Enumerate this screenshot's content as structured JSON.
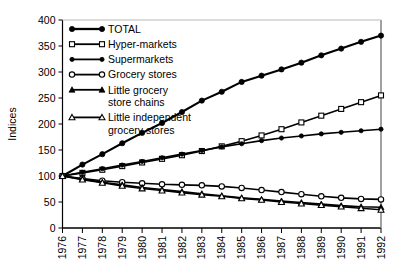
{
  "chart_data": {
    "type": "line",
    "title": "",
    "subtitle": "",
    "xlabel": "",
    "ylabel": "Indices",
    "xlim": [
      1976,
      1992
    ],
    "ylim": [
      0,
      400
    ],
    "yticks": [
      0,
      50,
      100,
      150,
      200,
      250,
      300,
      350,
      400
    ],
    "grid": false,
    "legend_position": "top-left-inside",
    "x": [
      1976,
      1977,
      1978,
      1979,
      1980,
      1981,
      1982,
      1983,
      1984,
      1985,
      1986,
      1987,
      1988,
      1989,
      1990,
      1991,
      1992
    ],
    "categories": [
      "1976",
      "1977",
      "1978",
      "1979",
      "1980",
      "1981",
      "1982",
      "1983",
      "1984",
      "1985",
      "1986",
      "1987",
      "1988",
      "1989",
      "1990",
      "1991",
      "1992"
    ],
    "series": [
      {
        "name": "TOTAL",
        "marker": "filled-circle",
        "values": [
          100,
          122,
          142,
          163,
          183,
          202,
          223,
          245,
          262,
          281,
          293,
          305,
          318,
          332,
          345,
          358,
          370
        ]
      },
      {
        "name": "Hyper-markets",
        "marker": "open-square",
        "values": [
          100,
          106,
          112,
          119,
          126,
          133,
          140,
          148,
          157,
          167,
          178,
          190,
          203,
          216,
          229,
          242,
          255
        ]
      },
      {
        "name": "Supermarkets",
        "marker": "filled-circle-small",
        "values": [
          100,
          107,
          114,
          121,
          128,
          135,
          142,
          149,
          156,
          162,
          168,
          173,
          177,
          181,
          184,
          187,
          190
        ]
      },
      {
        "name": "Grocery stores",
        "marker": "open-circle",
        "values": [
          100,
          95,
          91,
          88,
          86,
          84,
          83,
          82,
          80,
          77,
          73,
          69,
          65,
          61,
          58,
          56,
          55
        ]
      },
      {
        "name": "Little grocery store chains",
        "marker": "filled-triangle",
        "values": [
          100,
          94,
          88,
          83,
          78,
          74,
          70,
          66,
          62,
          58,
          55,
          52,
          49,
          46,
          43,
          41,
          40
        ]
      },
      {
        "name": "Little independent grocery stores",
        "marker": "open-triangle",
        "values": [
          100,
          93,
          87,
          81,
          76,
          72,
          68,
          64,
          61,
          57,
          54,
          50,
          47,
          44,
          41,
          38,
          35
        ]
      }
    ]
  },
  "legend": {
    "items": [
      {
        "label": "TOTAL",
        "marker": "filled-circle"
      },
      {
        "label": "Hyper-markets",
        "marker": "open-square"
      },
      {
        "label": "Supermarkets",
        "marker": "filled-circle-small"
      },
      {
        "label": "Grocery stores",
        "marker": "open-circle"
      },
      {
        "label": "Little grocery",
        "label2": "store chains",
        "marker": "filled-triangle"
      },
      {
        "label": "Little independent",
        "label2": "grocery stores",
        "marker": "open-triangle"
      }
    ]
  },
  "colors": {
    "line": "#000000",
    "axis": "#000000",
    "background": "#ffffff"
  }
}
